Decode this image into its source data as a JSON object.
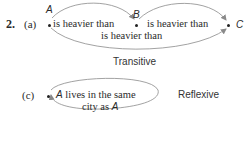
{
  "problem": {
    "number": "2.",
    "parts": [
      {
        "label": "(a)",
        "nodes": [
          "A",
          "B",
          "C"
        ],
        "edges": [
          {
            "from": "A",
            "to": "B",
            "label": "is heavier than"
          },
          {
            "from": "B",
            "to": "C",
            "label": "is heavier than"
          },
          {
            "from": "A",
            "to": "C",
            "label": "is heavier than"
          }
        ],
        "property": "Transitive"
      },
      {
        "label": "(c)",
        "nodes": [
          "A"
        ],
        "loop_label_line1": "A lives in the same",
        "loop_label_line1_var": "A",
        "loop_label_line1_rest": " lives in the same",
        "loop_label_line2_text": "city as ",
        "loop_label_line2_var": "A",
        "property": "Reflexive"
      }
    ]
  },
  "colors": {
    "text": "#2a2a2a",
    "arc": "#8a8a8a"
  }
}
